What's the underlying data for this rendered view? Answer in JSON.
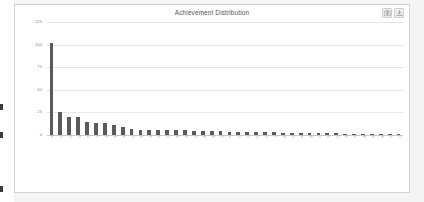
{
  "card": {
    "title": "Achievement Distribution",
    "toolbar": [
      {
        "name": "camera-icon",
        "label": "Camera"
      },
      {
        "name": "download-icon",
        "label": "Download"
      }
    ]
  },
  "chart_data": {
    "type": "bar",
    "title": "Achievement Distribution",
    "xlabel": "",
    "ylabel": "",
    "ylim": [
      0,
      125
    ],
    "yticks": [
      0,
      25,
      50,
      75,
      100,
      125
    ],
    "grid": true,
    "legend": false,
    "bar_color": "#5a5a5a",
    "categories": [
      "Perfectionist",
      "Completionist",
      "Journey's End in Sight Achievement",
      "Quiz Champion",
      "First Steps Forward",
      "Team Collaborator",
      "Speed Runner Challenge",
      "Night Owl Scholar",
      "Knowledge Seeker Level One",
      "Course Conqueror",
      "Early Bird Learner",
      "Steady Progress Maker",
      "Peer Reviewer Badge",
      "Discussion Leader",
      "Milestone Achiever",
      "Weekly Streak Holder",
      "Quick Learner",
      "Module Master",
      "Assignment Ace",
      "Resource Explorer",
      "Feedback Champion",
      "Group Project Star",
      "Deep Diver",
      "Curious Mind Award",
      "Consistency Award",
      "Top Contributor",
      "Bookworm Badge",
      "Lab Specialist",
      "Problem Solver Elite",
      "Mentor in Training",
      "Creative Thinker",
      "Note Taker Supreme",
      "Question Asker",
      "Revision Regular",
      "Flawless Submission",
      "Marathon Session",
      "Weekend Warrior Scholar",
      "Archive Adventurer",
      "Final Push Finisher",
      "Legacy Learner"
    ],
    "values": [
      102,
      26,
      20,
      20,
      14,
      13,
      13,
      11,
      9,
      7,
      6,
      6,
      5,
      5,
      5,
      5,
      4,
      4,
      4,
      4,
      3,
      3,
      3,
      3,
      3,
      3,
      2,
      2,
      2,
      2,
      2,
      2,
      2,
      1,
      1,
      1,
      1,
      1,
      1,
      1
    ]
  },
  "page": {
    "background": "#f4f4f4",
    "edge_marks": 3
  }
}
